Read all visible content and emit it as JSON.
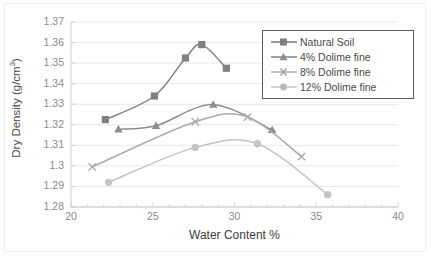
{
  "chart_data": {
    "type": "line",
    "title": "",
    "xlabel": "Water Content %",
    "ylabel": "Dry Density (g/cm",
    "ylabel_sup": "3",
    "ylabel_tail": ")",
    "xlim": [
      20,
      40
    ],
    "ylim": [
      1.28,
      1.37
    ],
    "xticks": [
      "20",
      "25",
      "30",
      "35",
      "40"
    ],
    "yticks": [
      "1.37",
      "1.36",
      "1.35",
      "1.34",
      "1.33",
      "1.32",
      "1.31",
      "1.3",
      "1.29",
      "1.28"
    ],
    "ytick_values": [
      1.37,
      1.36,
      1.35,
      1.34,
      1.33,
      1.32,
      1.31,
      1.3,
      1.29,
      1.28
    ],
    "xtick_values": [
      20,
      25,
      30,
      35,
      40
    ],
    "grid": true,
    "legend_position": "top-right",
    "series": [
      {
        "name": "Natural Soil",
        "marker": "square",
        "color": "#808080",
        "x": [
          22.1,
          25.1,
          27.0,
          28.0,
          29.5
        ],
        "y": [
          1.3225,
          1.334,
          1.3525,
          1.359,
          1.3475
        ]
      },
      {
        "name": "4% Dolime fine",
        "marker": "triangle",
        "color": "#8c8c8c",
        "x": [
          22.9,
          25.2,
          28.7,
          32.3
        ],
        "y": [
          1.3178,
          1.3195,
          1.3298,
          1.3175
        ]
      },
      {
        "name": "8% Dolime fine",
        "marker": "cross",
        "color": "#aaaaaa",
        "x": [
          21.3,
          27.6,
          30.8,
          34.1
        ],
        "y": [
          1.2995,
          1.3215,
          1.3238,
          1.3045
        ]
      },
      {
        "name": "12% Dolime fine",
        "marker": "circle",
        "color": "#c4c4c4",
        "x": [
          22.3,
          27.6,
          31.4,
          35.7
        ],
        "y": [
          1.292,
          1.309,
          1.3108,
          1.286
        ]
      }
    ]
  },
  "legend": {
    "items": [
      {
        "label": "Natural Soil"
      },
      {
        "label": "4% Dolime fine"
      },
      {
        "label": "8% Dolime fine"
      },
      {
        "label": "12% Dolime fine"
      }
    ]
  }
}
